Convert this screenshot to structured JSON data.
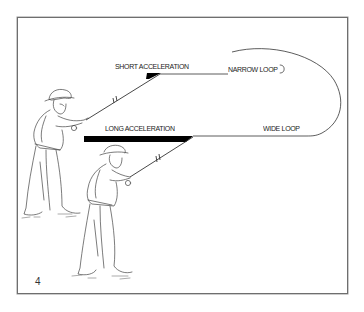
{
  "figure": {
    "number": "4",
    "labels": {
      "short_acceleration": "SHORT ACCELERATION",
      "narrow_loop": "NARROW LOOP",
      "long_acceleration": "LONG ACCELERATION",
      "wide_loop": "WIDE LOOP"
    },
    "colors": {
      "frame": "#6e6e6e",
      "ink": "#222222",
      "acceleration_bar": "#000000",
      "background": "#ffffff"
    }
  }
}
